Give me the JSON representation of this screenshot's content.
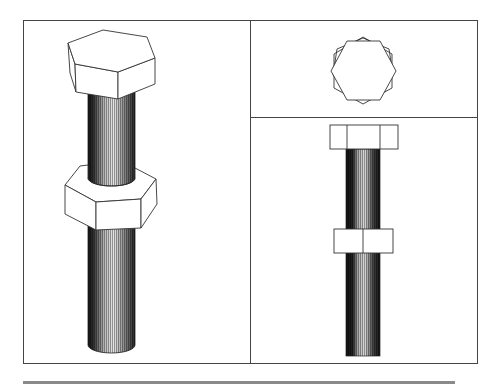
{
  "figure": {
    "title": "",
    "panels": [
      {
        "id": "isometric-view",
        "label": ""
      },
      {
        "id": "top-view",
        "label": ""
      },
      {
        "id": "front-view",
        "label": ""
      }
    ],
    "colors": {
      "line": "#333333",
      "thread_dark": "#1a1a1a",
      "thread_mid": "#7a7a7a",
      "thread_light": "#d8d8d8",
      "face": "#ffffff",
      "bottom_bar": "#8a8a8a"
    }
  }
}
